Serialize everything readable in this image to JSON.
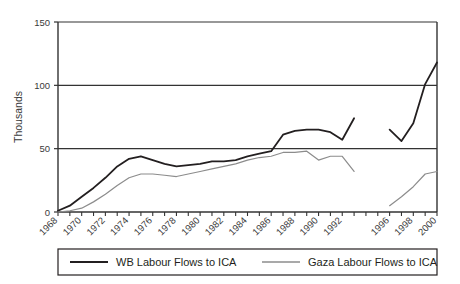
{
  "chart_data": {
    "type": "line",
    "title": "",
    "xlabel": "",
    "ylabel": "Thousands",
    "ylim": [
      0,
      150
    ],
    "yticks": [
      0,
      50,
      100,
      150
    ],
    "ytick_labels": [
      "0",
      "50",
      "100",
      "150"
    ],
    "xlim": [
      1968,
      2000
    ],
    "xticks": [
      1968,
      1969,
      1970,
      1971,
      1972,
      1973,
      1974,
      1975,
      1976,
      1977,
      1978,
      1979,
      1980,
      1981,
      1982,
      1983,
      1984,
      1985,
      1986,
      1987,
      1988,
      1989,
      1990,
      1991,
      1992,
      1993,
      1994,
      1995,
      1996,
      1997,
      1998,
      1999,
      2000
    ],
    "xtick_labels": [
      "1968",
      "",
      "1970",
      "",
      "1972",
      "",
      "1974",
      "",
      "1976",
      "",
      "1978",
      "",
      "1980",
      "",
      "1982",
      "",
      "1984",
      "",
      "1986",
      "",
      "1988",
      "",
      "1990",
      "",
      "1992",
      "",
      "",
      "",
      "1996",
      "",
      "1998",
      "",
      "2000"
    ],
    "grid": "horizontal-major",
    "legend_position": "bottom",
    "series": [
      {
        "name": "WB Labour Flows to ICA",
        "color": "#231f20",
        "width": 1.8,
        "x": [
          1968,
          1969,
          1970,
          1971,
          1972,
          1973,
          1974,
          1975,
          1976,
          1977,
          1978,
          1979,
          1980,
          1981,
          1982,
          1983,
          1984,
          1985,
          1986,
          1987,
          1988,
          1989,
          1990,
          1991,
          1992,
          1993,
          1996,
          1997,
          1998,
          1999,
          2000
        ],
        "values": [
          1,
          5,
          12,
          19,
          27,
          36,
          42,
          44,
          41,
          38,
          36,
          37,
          38,
          40,
          40,
          41,
          44,
          46,
          48,
          61,
          64,
          65,
          65,
          63,
          57,
          74,
          65,
          56,
          70,
          101,
          118
        ]
      },
      {
        "name": "Gaza Labour Flows to ICA",
        "color": "#8c8c8c",
        "width": 1.2,
        "x": [
          1968,
          1969,
          1970,
          1971,
          1972,
          1973,
          1974,
          1975,
          1976,
          1977,
          1978,
          1979,
          1980,
          1981,
          1982,
          1983,
          1984,
          1985,
          1986,
          1987,
          1988,
          1989,
          1990,
          1991,
          1992,
          1993,
          1996,
          1997,
          1998,
          1999,
          2000
        ],
        "values": [
          0,
          1,
          3,
          8,
          14,
          21,
          27,
          30,
          30,
          29,
          28,
          30,
          32,
          34,
          36,
          38,
          41,
          43,
          44,
          47,
          47,
          48,
          41,
          44,
          44,
          32,
          5,
          12,
          20,
          30,
          32
        ]
      }
    ]
  },
  "legend": {
    "items": [
      {
        "label": "WB Labour Flows to ICA",
        "color": "#231f20"
      },
      {
        "label": "Gaza Labour Flows to ICA",
        "color": "#8c8c8c"
      }
    ]
  }
}
